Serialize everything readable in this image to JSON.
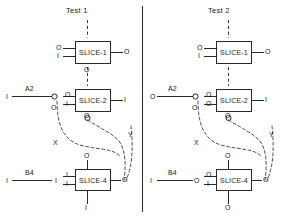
{
  "diagram": {
    "kind": "schematic-two-panel-slice-test-diagram",
    "divider": "vertical-separator"
  },
  "panels": [
    {
      "id": "left",
      "title": "Test 1",
      "blocks": [
        {
          "id": "left-slice-1",
          "label": "SLICE-1",
          "pin_left_top": "O",
          "pin_left_bottom": "I",
          "pin_right": "O",
          "pin_bottom": "O",
          "pin_top": ""
        },
        {
          "id": "left-slice-2",
          "label": "SLICE-2",
          "pin_left_top": "O",
          "pin_left_bottom": "I",
          "pin_right": "I",
          "pin_bottom": "O",
          "pin_top": ""
        },
        {
          "id": "left-slice-4",
          "label": "SLICE-4",
          "pin_left_top": "I",
          "pin_left_bottom": "I",
          "pin_right": "O",
          "pin_top": "O",
          "pin_bottom": "I"
        }
      ],
      "nets": [
        {
          "id": "left-net-a2",
          "label": "A2",
          "left_end": "I",
          "right_end": "O"
        },
        {
          "id": "left-net-b4",
          "label": "B4",
          "left_end": "I",
          "right_end": "I"
        }
      ],
      "paths": [
        {
          "id": "left-path-x",
          "label": "X"
        },
        {
          "id": "left-path-y",
          "label": "Y"
        }
      ],
      "stub_left_of_slice2": "O"
    },
    {
      "id": "right",
      "title": "Test 2",
      "blocks": [
        {
          "id": "right-slice-1",
          "label": "SLICE-1",
          "pin_left_top": "O",
          "pin_left_bottom": "I",
          "pin_right": "O",
          "pin_bottom": "",
          "pin_top": ""
        },
        {
          "id": "right-slice-2",
          "label": "SLICE-2",
          "pin_left_top": "O",
          "pin_left_bottom": "O",
          "pin_right": "I",
          "pin_bottom": "O",
          "pin_top": ""
        },
        {
          "id": "right-slice-4",
          "label": "SLICE-4",
          "pin_left_top": "O",
          "pin_left_bottom": "I",
          "pin_right": "O",
          "pin_top": "O",
          "pin_bottom": "O"
        }
      ],
      "nets": [
        {
          "id": "right-net-a2",
          "label": "A2",
          "left_end": "O",
          "right_end": "O"
        },
        {
          "id": "right-net-b4",
          "label": "B4",
          "left_end": "I",
          "right_end": "O"
        }
      ],
      "paths": [
        {
          "id": "right-path-x",
          "label": "X"
        },
        {
          "id": "right-path-y",
          "label": "Y"
        }
      ],
      "stub_left_of_slice2": "O"
    }
  ],
  "colors": {
    "ink": "#2a2a2a",
    "background": "#ffffff",
    "dashed": "#4a4a4a"
  }
}
